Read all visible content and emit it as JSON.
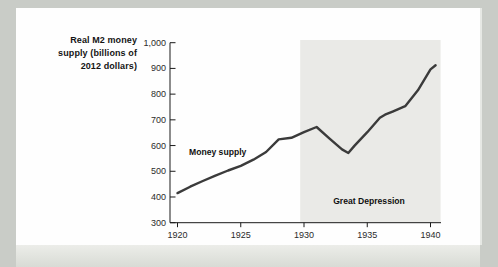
{
  "page": {
    "background_color": "#c9ccc7",
    "card_color": "#fefefe"
  },
  "chart_data": {
    "type": "line",
    "title": "",
    "axis_title": "Real M2 money\nsupply (billions of\n2012 dollars)",
    "xlabel": "",
    "ylabel": "Real M2 money supply (billions of 2012 dollars)",
    "x_ticks": [
      1920,
      1925,
      1930,
      1935,
      1940
    ],
    "x_range": [
      1919.4,
      1940.85
    ],
    "y_range": [
      300,
      1000
    ],
    "y_ticks": [
      [
        1000,
        "1,000"
      ],
      [
        900,
        "900"
      ],
      [
        800,
        "800"
      ],
      [
        700,
        "700"
      ],
      [
        600,
        "600"
      ],
      [
        500,
        "500"
      ],
      [
        400,
        "400"
      ],
      [
        300,
        "300"
      ]
    ],
    "grid": false,
    "legend": "none",
    "line_color": "#3b3b3b",
    "axis_color": "#1a1a1a",
    "annotations": {
      "line_label": "Money supply",
      "region_label": "Great Depression"
    },
    "shaded_region": {
      "label": "Great Depression",
      "x_span": [
        1929.7,
        1940.8
      ],
      "color": "#eaeae7"
    },
    "series": [
      {
        "name": "Money supply",
        "points": [
          [
            1920,
            415
          ],
          [
            1921,
            440
          ],
          [
            1922,
            462
          ],
          [
            1923,
            483
          ],
          [
            1924,
            503
          ],
          [
            1925,
            521
          ],
          [
            1926,
            545
          ],
          [
            1927,
            575
          ],
          [
            1928,
            624
          ],
          [
            1929,
            630
          ],
          [
            1930,
            652
          ],
          [
            1931,
            672
          ],
          [
            1932,
            628
          ],
          [
            1933,
            585
          ],
          [
            1933.5,
            571
          ],
          [
            1934,
            600
          ],
          [
            1935,
            652
          ],
          [
            1936,
            708
          ],
          [
            1936.4,
            720
          ],
          [
            1937,
            732
          ],
          [
            1938,
            753
          ],
          [
            1939,
            815
          ],
          [
            1940,
            896
          ],
          [
            1940.4,
            912
          ]
        ]
      }
    ]
  }
}
